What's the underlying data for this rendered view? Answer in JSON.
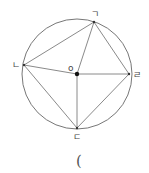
{
  "diagram": {
    "circle": {
      "cx": 77,
      "cy": 74,
      "r": 55,
      "stroke": "#777777"
    },
    "points": {
      "g": {
        "label": "ㄱ",
        "x": 94,
        "y": 22
      },
      "n": {
        "label": "ㄴ",
        "x": 24,
        "y": 65
      },
      "d": {
        "label": "ㄷ",
        "x": 77,
        "y": 128
      },
      "r": {
        "label": "ㄹ",
        "x": 129,
        "y": 74
      },
      "o": {
        "label": "o",
        "x": 77,
        "y": 74
      }
    },
    "line_color": "#8a8a8a",
    "center_dot_color": "#111111"
  },
  "answer_blank": {
    "text": "("
  }
}
